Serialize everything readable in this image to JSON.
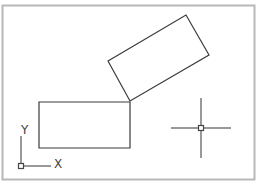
{
  "drawing_area": {
    "border_color": "#b0b0b0",
    "line_color": "#3a3a3a",
    "background": "#ffffff"
  },
  "objects": {
    "rectangle_1": {
      "points": "39,102 130,102 130,148 39,148"
    },
    "rectangle_2": {
      "points": "108,61 186,15 209,55 130,101"
    }
  },
  "ucs_icon": {
    "x_label": "X",
    "y_label": "Y"
  },
  "crosshair": {
    "center_x": 201,
    "center_y": 128
  }
}
